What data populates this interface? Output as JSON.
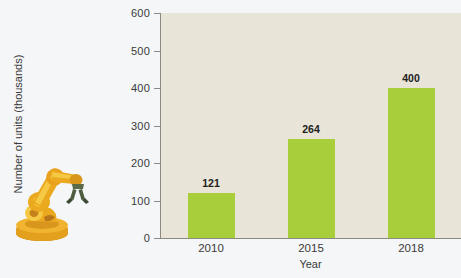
{
  "chart_data": {
    "type": "bar",
    "title": "",
    "xlabel": "Year",
    "ylabel": "Number of units (thousands)",
    "categories": [
      "2010",
      "2015",
      "2018"
    ],
    "values": [
      121,
      264,
      400
    ],
    "value_labels": [
      "121",
      "264",
      "400"
    ],
    "ylim": [
      0,
      600
    ],
    "yticks": [
      0,
      100,
      200,
      300,
      400,
      500,
      600
    ],
    "ytick_labels": [
      "0",
      "100",
      "200",
      "300",
      "400",
      "500",
      "600"
    ],
    "grid": false,
    "legend": false,
    "bar_color": "#a9ce3c",
    "plot_background": "#e9e4d8",
    "figure_background": "#f4f6f8",
    "axis_color": "#8a8a85",
    "text_color": "#3a3a3a"
  },
  "illustration": {
    "name": "industrial-robot-arm",
    "primary_color": "#eba91f",
    "highlight_color": "#f6c944",
    "shadow_color": "#c4831a",
    "gripper_color": "#5a6a4a"
  }
}
